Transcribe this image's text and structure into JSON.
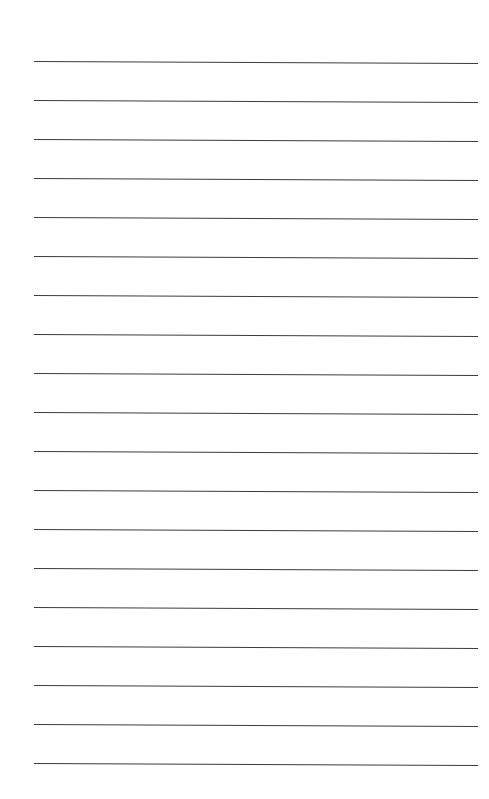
{
  "document": {
    "type": "lined-paper",
    "background_color": "#ffffff",
    "line_color": "#3c3c3c",
    "line_count": 19,
    "line_left": 34,
    "line_right": 478,
    "lines": [
      {
        "y": 61
      },
      {
        "y": 100
      },
      {
        "y": 139
      },
      {
        "y": 178
      },
      {
        "y": 217
      },
      {
        "y": 256
      },
      {
        "y": 295
      },
      {
        "y": 334
      },
      {
        "y": 373
      },
      {
        "y": 412
      },
      {
        "y": 451
      },
      {
        "y": 490
      },
      {
        "y": 529
      },
      {
        "y": 568
      },
      {
        "y": 607
      },
      {
        "y": 646
      },
      {
        "y": 685
      },
      {
        "y": 724
      },
      {
        "y": 763
      }
    ]
  }
}
